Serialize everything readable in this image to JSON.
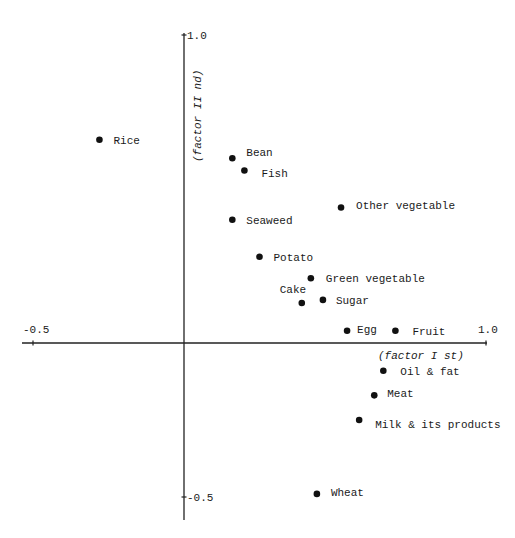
{
  "chart_data": {
    "type": "scatter",
    "title": "",
    "xlabel": "(factor I st)",
    "ylabel": "(factor II nd)",
    "xlim": [
      -0.5,
      1.0
    ],
    "ylim": [
      -0.5,
      1.0
    ],
    "grid": false,
    "legend": "none",
    "x_ticks": [
      {
        "value": -0.5,
        "label": "-0.5"
      },
      {
        "value": 1.0,
        "label": "1.0"
      }
    ],
    "y_ticks": [
      {
        "value": 1.0,
        "label": "1.0"
      },
      {
        "value": -0.5,
        "label": "-0.5"
      }
    ],
    "points": [
      {
        "label": "Rice",
        "x": -0.28,
        "y": 0.66,
        "label_dx": 14,
        "label_dy": 4
      },
      {
        "label": "Bean",
        "x": 0.16,
        "y": 0.6,
        "label_dx": 14,
        "label_dy": -2
      },
      {
        "label": "Fish",
        "x": 0.2,
        "y": 0.56,
        "label_dx": 17,
        "label_dy": 6
      },
      {
        "label": "Seaweed",
        "x": 0.16,
        "y": 0.4,
        "label_dx": 14,
        "label_dy": 4
      },
      {
        "label": "Other vegetable",
        "x": 0.52,
        "y": 0.44,
        "label_dx": 15,
        "label_dy": 2
      },
      {
        "label": "Potato",
        "x": 0.25,
        "y": 0.28,
        "label_dx": 14,
        "label_dy": 4
      },
      {
        "label": "Green vegetable",
        "x": 0.42,
        "y": 0.21,
        "label_dx": 15,
        "label_dy": 4
      },
      {
        "label": "Cake",
        "x": 0.39,
        "y": 0.13,
        "label_dx": -22,
        "label_dy": -10
      },
      {
        "label": "Sugar",
        "x": 0.46,
        "y": 0.14,
        "label_dx": 13,
        "label_dy": 4
      },
      {
        "label": "Egg",
        "x": 0.54,
        "y": 0.04,
        "label_dx": 10,
        "label_dy": 2
      },
      {
        "label": "Fruit",
        "x": 0.7,
        "y": 0.04,
        "label_dx": 17,
        "label_dy": 0
      },
      {
        "label": "Oil & fat",
        "x": 0.66,
        "y": -0.09,
        "label_dx": 17,
        "label_dy": 4
      },
      {
        "label": "Meat",
        "x": 0.63,
        "y": -0.17,
        "label_dx": 13,
        "label_dy": 2
      },
      {
        "label": "Milk & its products",
        "x": 0.58,
        "y": -0.25,
        "label_dx": 16,
        "label_dy": 8
      },
      {
        "label": "Wheat",
        "x": 0.44,
        "y": -0.49,
        "label_dx": 14,
        "label_dy": 2
      }
    ]
  },
  "colors": {
    "ink": "#111111",
    "background": "#ffffff"
  }
}
